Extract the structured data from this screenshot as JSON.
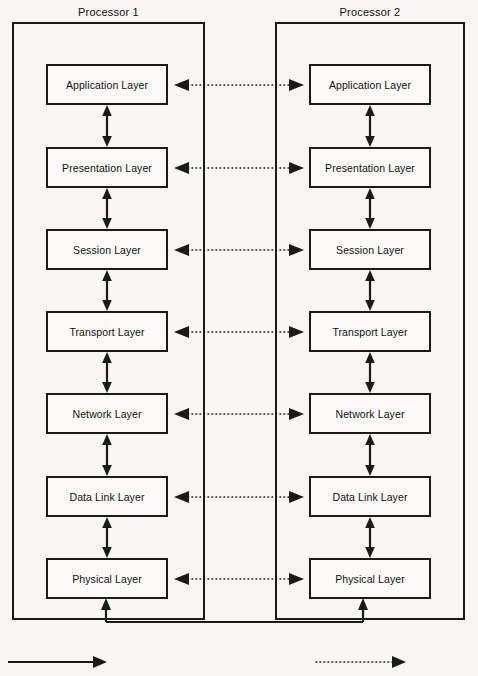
{
  "diagram": {
    "background_color": "#f7f6f3",
    "line_color": "#1a1a1a"
  },
  "panels": [
    {
      "id": "processor-1",
      "title": "Processor 1"
    },
    {
      "id": "processor-2",
      "title": "Processor 2"
    }
  ],
  "layers": [
    {
      "index": 1,
      "name": "Application Layer"
    },
    {
      "index": 2,
      "name": "Presentation Layer"
    },
    {
      "index": 3,
      "name": "Session Layer"
    },
    {
      "index": 4,
      "name": "Transport Layer"
    },
    {
      "index": 5,
      "name": "Network Layer"
    },
    {
      "index": 6,
      "name": "Data Link Layer"
    },
    {
      "index": 7,
      "name": "Physical Layer"
    }
  ],
  "left_stack": {
    "layer_1": "Application Layer",
    "layer_2": "Presentation Layer",
    "layer_3": "Session Layer",
    "layer_4": "Transport Layer",
    "layer_5": "Network Layer",
    "layer_6": "Data Link Layer",
    "layer_7": "Physical Layer"
  },
  "right_stack": {
    "layer_1": "Application Layer",
    "layer_2": "Presentation Layer",
    "layer_3": "Session Layer",
    "layer_4": "Transport Layer",
    "layer_5": "Network Layer",
    "layer_6": "Data Link Layer",
    "layer_7": "Physical Layer"
  },
  "connectors": {
    "peer_links_count": 7,
    "peer_link_style": "dotted-double-arrow",
    "intra_stack_link_style": "solid-double-arrow",
    "physical_medium_style": "solid-line-with-up-arrows"
  },
  "legend": {
    "solid_arrow_style": "solid-single-arrow",
    "dotted_arrow_style": "dotted-single-arrow"
  }
}
